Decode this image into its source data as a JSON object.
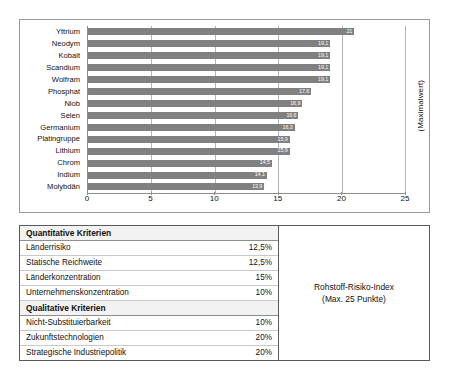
{
  "chart_data": {
    "type": "bar",
    "orientation": "horizontal",
    "title": "",
    "xlabel": "",
    "ylabel": "",
    "axis_title_right": "(Maximalwert)",
    "categories": [
      "Yttrium",
      "Neodym",
      "Kobalt",
      "Scandium",
      "Wolfram",
      "Phosphat",
      "Niob",
      "Selen",
      "Germanium",
      "Platingruppe",
      "Lithium",
      "Chrom",
      "Indium",
      "Molybdän"
    ],
    "values": [
      21,
      19.1,
      19.1,
      19.1,
      19.1,
      17.6,
      16.9,
      16.6,
      16.3,
      15.9,
      15.9,
      14.5,
      14.1,
      13.9
    ],
    "value_labels": [
      "21",
      "19,1",
      "19,1",
      "19,1",
      "19,1",
      "17,6",
      "16,9",
      "16,6",
      "16,3",
      "15,9",
      "15,9",
      "14,5",
      "14,1",
      "13,9"
    ],
    "xlim": [
      0,
      25
    ],
    "xticks": [
      0,
      5,
      10,
      15,
      20,
      25
    ],
    "xtick_labels": [
      "0",
      "5",
      "10",
      "15",
      "20",
      "25"
    ],
    "grid": true,
    "legend": false,
    "bar_color": "#808080",
    "value_label_color": "#ffffff"
  },
  "criteria_table": {
    "sections": [
      {
        "heading": "Quantitative Kriterien",
        "rows": [
          {
            "name": "Länderrisiko",
            "weight": "12,5%"
          },
          {
            "name": "Statische Reichweite",
            "weight": "12,5%"
          },
          {
            "name": "Länderkonzentration",
            "weight": "15%"
          },
          {
            "name": "Unternehmenskonzentration",
            "weight": "10%"
          }
        ]
      },
      {
        "heading": "Qualitative Kriterien",
        "rows": [
          {
            "name": "Nicht-Substituierbarkeit",
            "weight": "10%"
          },
          {
            "name": "Zukunftstechnologien",
            "weight": "20%"
          },
          {
            "name": "Strategische Industriepolitik",
            "weight": "20%"
          }
        ]
      }
    ],
    "index_box": {
      "line1": "Rohstoff-Risiko-Index",
      "line2": "(Max. 25 Punkte)"
    }
  },
  "caption": {
    "text": ""
  }
}
